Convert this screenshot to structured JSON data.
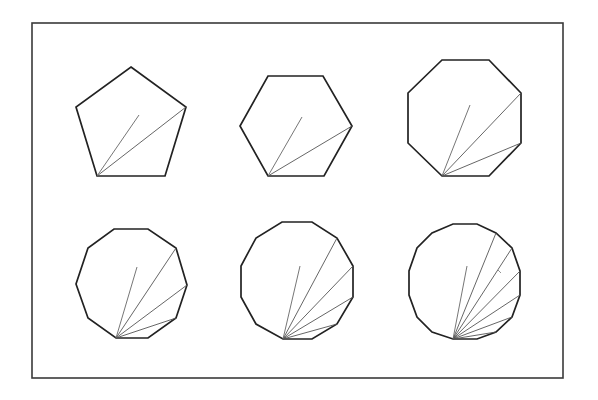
{
  "figure": {
    "width": 598,
    "height": 400,
    "frame": {
      "x": 32,
      "y": 23,
      "width": 531,
      "height": 355,
      "color": "#3a3a3a"
    },
    "colors": {
      "polygon_stroke": "#222222",
      "diagonal_stroke": "#555555",
      "radius_stroke": "#666666"
    },
    "polygons": [
      {
        "name": "pentagon",
        "sides": 5,
        "vertices": [
          [
            131,
            67
          ],
          [
            186,
            107
          ],
          [
            165,
            176
          ],
          [
            97,
            176
          ],
          [
            76,
            107
          ]
        ],
        "apex": [
          97,
          176
        ],
        "diagonals_to": [
          [
            186,
            107
          ]
        ],
        "radius_to": [
          139,
          115
        ]
      },
      {
        "name": "hexagon",
        "sides": 6,
        "vertices": [
          [
            268,
            76
          ],
          [
            323,
            76
          ],
          [
            352,
            126
          ],
          [
            324,
            176
          ],
          [
            268,
            176
          ],
          [
            240,
            126
          ]
        ],
        "apex": [
          268,
          176
        ],
        "diagonals_to": [
          [
            352,
            126
          ]
        ],
        "radius_to": [
          302,
          117
        ]
      },
      {
        "name": "octagon",
        "sides": 8,
        "vertices": [
          [
            442,
            60
          ],
          [
            489,
            60
          ],
          [
            521,
            93
          ],
          [
            521,
            143
          ],
          [
            489,
            176
          ],
          [
            442,
            176
          ],
          [
            408,
            143
          ],
          [
            408,
            93
          ]
        ],
        "apex": [
          442,
          176
        ],
        "diagonals_to": [
          [
            521,
            93
          ],
          [
            521,
            143
          ]
        ],
        "radius_to": [
          470,
          105
        ]
      },
      {
        "name": "decagon",
        "sides": 10,
        "vertices": [
          [
            114,
            229
          ],
          [
            148,
            229
          ],
          [
            176,
            248
          ],
          [
            187,
            285
          ],
          [
            176,
            318
          ],
          [
            148,
            338
          ],
          [
            116,
            338
          ],
          [
            88,
            318
          ],
          [
            76,
            284
          ],
          [
            88,
            248
          ]
        ],
        "apex": [
          116,
          338
        ],
        "diagonals_to": [
          [
            176,
            248
          ],
          [
            187,
            285
          ],
          [
            176,
            318
          ]
        ],
        "radius_to": [
          137,
          267
        ]
      },
      {
        "name": "dodecagon",
        "sides": 12,
        "vertices": [
          [
            282,
            222
          ],
          [
            312,
            222
          ],
          [
            337,
            238
          ],
          [
            353,
            266
          ],
          [
            353,
            297
          ],
          [
            337,
            324
          ],
          [
            312,
            339
          ],
          [
            283,
            339
          ],
          [
            256,
            324
          ],
          [
            241,
            297
          ],
          [
            241,
            266
          ],
          [
            256,
            238
          ]
        ],
        "apex": [
          283,
          339
        ],
        "diagonals_to": [
          [
            337,
            238
          ],
          [
            353,
            266
          ],
          [
            353,
            297
          ],
          [
            337,
            324
          ]
        ],
        "radius_to": [
          300,
          266
        ]
      },
      {
        "name": "hexadecagon",
        "sides": 16,
        "vertices": [
          [
            453,
            224
          ],
          [
            477,
            224
          ],
          [
            496,
            233
          ],
          [
            512,
            248
          ],
          [
            520,
            271
          ],
          [
            520,
            295
          ],
          [
            512,
            317
          ],
          [
            496,
            332
          ],
          [
            477,
            339
          ],
          [
            453,
            339
          ],
          [
            432,
            332
          ],
          [
            417,
            317
          ],
          [
            409,
            295
          ],
          [
            409,
            271
          ],
          [
            417,
            248
          ],
          [
            432,
            233
          ]
        ],
        "apex": [
          453,
          339
        ],
        "diagonals_to": [
          [
            496,
            233
          ],
          [
            512,
            248
          ],
          [
            520,
            271
          ],
          [
            520,
            295
          ],
          [
            512,
            317
          ],
          [
            496,
            332
          ]
        ],
        "radius_to": [
          467,
          266
        ],
        "tick_mark": [
          [
            498,
            270
          ],
          [
            501,
            273
          ]
        ]
      }
    ]
  }
}
